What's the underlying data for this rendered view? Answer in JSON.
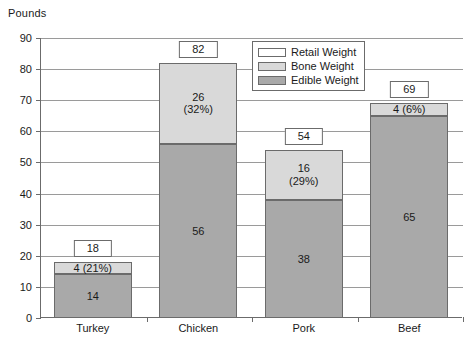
{
  "chart_data": {
    "type": "bar",
    "subtype": "stacked",
    "title": "",
    "xlabel": "",
    "ylabel": "Pounds",
    "ylim": [
      0,
      90
    ],
    "ytick_step": 10,
    "yticks": [
      "0",
      "10",
      "20",
      "30",
      "40",
      "50",
      "60",
      "70",
      "80",
      "90"
    ],
    "grid": true,
    "legend_position": "inside-top-center",
    "categories": [
      "Turkey",
      "Chicken",
      "Pork",
      "Beef"
    ],
    "series": [
      {
        "name": "Edible Weight",
        "color": "#a9a9a9",
        "values": [
          14,
          56,
          38,
          65
        ]
      },
      {
        "name": "Bone Weight",
        "color": "#d9d9d9",
        "values": [
          4,
          26,
          16,
          4
        ]
      },
      {
        "name": "Retail Weight",
        "color": "#ffffff",
        "values": [
          18,
          82,
          54,
          69
        ]
      }
    ],
    "totals": [
      18,
      82,
      54,
      69
    ],
    "bars": [
      {
        "category": "Turkey",
        "total_label": "18",
        "bone_label": "4 (21%)",
        "edible_label": "14",
        "edible": 14,
        "bone": 4,
        "total": 18,
        "bone_percent": "21%"
      },
      {
        "category": "Chicken",
        "total_label": "82",
        "bone_label": "26",
        "bone_label_pct": "(32%)",
        "edible_label": "56",
        "edible": 56,
        "bone": 26,
        "total": 82,
        "bone_percent": "32%"
      },
      {
        "category": "Pork",
        "total_label": "54",
        "bone_label": "16",
        "bone_label_pct": "(29%)",
        "edible_label": "38",
        "edible": 38,
        "bone": 16,
        "total": 54,
        "bone_percent": "29%"
      },
      {
        "category": "Beef",
        "total_label": "69",
        "bone_label": "4 (6%)",
        "edible_label": "65",
        "edible": 65,
        "bone": 4,
        "total": 69,
        "bone_percent": "6%"
      }
    ]
  },
  "legend": {
    "items": [
      {
        "label": "Retail Weight",
        "color": "#ffffff"
      },
      {
        "label": "Bone Weight",
        "color": "#d9d9d9"
      },
      {
        "label": "Edible Weight",
        "color": "#a9a9a9"
      }
    ]
  },
  "axis": {
    "y_title": "Pounds"
  }
}
